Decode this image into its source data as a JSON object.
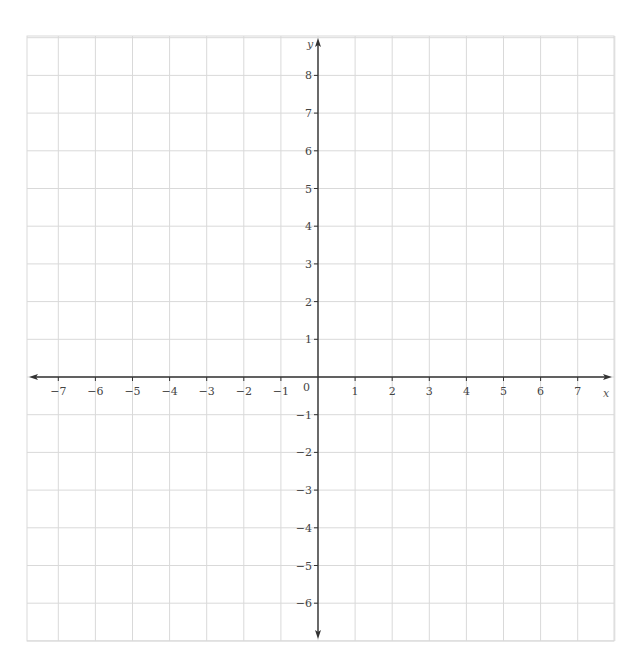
{
  "chart_data": {
    "type": "scatter",
    "title": "",
    "xlabel": "x",
    "ylabel": "y",
    "xlim": [
      -7.8,
      7.8
    ],
    "ylim": [
      -7,
      9
    ],
    "grid": true,
    "x_ticks": [
      -7,
      -6,
      -5,
      -4,
      -3,
      -2,
      -1,
      1,
      2,
      3,
      4,
      5,
      6,
      7
    ],
    "y_ticks": [
      -6,
      -5,
      -4,
      -3,
      -2,
      -1,
      1,
      2,
      3,
      4,
      5,
      6,
      7,
      8
    ],
    "origin_label": "0",
    "series": [],
    "colors": {
      "grid": "#d9d9d9",
      "axis": "#333333",
      "labels": "#444444"
    }
  },
  "layout": {
    "grid_left": 27,
    "grid_right": 614,
    "grid_top": 36,
    "grid_bottom": 641,
    "origin_x": 318,
    "origin_y": 377,
    "dx": 37.1,
    "dy": 37.7
  }
}
